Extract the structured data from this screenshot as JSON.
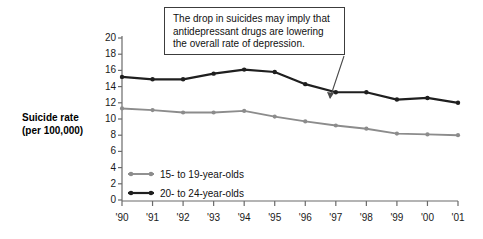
{
  "chart_data": {
    "type": "line",
    "title": "",
    "subtitle": "",
    "xlabel": "",
    "ylabel": "Suicide rate (per 100,000)",
    "ylabel_line1": "Suicide rate",
    "ylabel_line2": "(per 100,000)",
    "x": [
      "'90",
      "'91",
      "'92",
      "'93",
      "'94",
      "'95",
      "'96",
      "'97",
      "'98",
      "'99",
      "'00",
      "'01"
    ],
    "categories": [
      "'90",
      "'91",
      "'92",
      "'93",
      "'94",
      "'95",
      "'96",
      "'97",
      "'98",
      "'99",
      "'00",
      "'01"
    ],
    "xlim": [
      1990,
      2001
    ],
    "ylim": [
      0,
      20
    ],
    "ytick_labels": [
      "20",
      "18",
      "16",
      "14",
      "12",
      "10",
      "8",
      "6",
      "4",
      "2",
      "0"
    ],
    "ytick_values": [
      20,
      18,
      16,
      14,
      12,
      10,
      8,
      6,
      4,
      2,
      0
    ],
    "grid": false,
    "legend_position": "inside-lower-left",
    "series": [
      {
        "name": "15- to 19-year-olds",
        "color": "#8c8c8c",
        "values": [
          11.3,
          11.1,
          10.8,
          10.8,
          11.0,
          10.3,
          9.7,
          9.2,
          8.8,
          8.2,
          8.1,
          8.0
        ]
      },
      {
        "name": "20- to 24-year-olds",
        "color": "#1f1f1f",
        "values": [
          15.2,
          14.9,
          14.9,
          15.6,
          16.1,
          15.8,
          14.3,
          13.3,
          13.3,
          12.4,
          12.6,
          12.0
        ]
      }
    ],
    "annotations": [
      {
        "text": "The drop in suicides may imply that antidepressant drugs are lowering the overall rate of depression.",
        "line1": "The drop in suicides may imply that",
        "line2": "antidepressant drugs are lowering",
        "line3": "the overall rate of depression.",
        "points_to_series": "20- to 24-year-olds",
        "points_to_x": "'97",
        "points_to_y": 13.3
      }
    ]
  },
  "legend": {
    "items": [
      {
        "label": "15- to 19-year-olds",
        "color": "#8c8c8c"
      },
      {
        "label": "20- to 24-year-olds",
        "color": "#1f1f1f"
      }
    ]
  },
  "colors": {
    "axis": "#6a6a6a",
    "text": "#111111",
    "series_teen": "#8c8c8c",
    "series_young": "#1f1f1f",
    "annotation_border": "#3c3c3c",
    "background": "#ffffff"
  }
}
